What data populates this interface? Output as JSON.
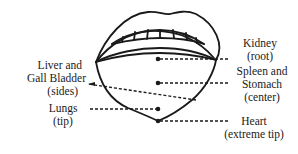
{
  "diagram": {
    "labels": {
      "kidney": {
        "name": "Kidney",
        "region": "(root)"
      },
      "spleen_stomach": {
        "line1": "Spleen and",
        "line2": "Stomach",
        "region": "(center)"
      },
      "heart": {
        "name": "Heart",
        "region": "(extreme tip)"
      },
      "liver": {
        "line1": "Liver and",
        "line2": "Gall Bladder",
        "region": "(sides)"
      },
      "lungs": {
        "name": "Lungs",
        "region": "(tip)"
      }
    },
    "colors": {
      "ink": "#1a1a1a",
      "background": "#ffffff"
    }
  }
}
